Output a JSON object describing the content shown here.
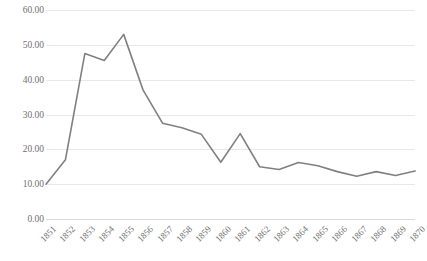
{
  "chart_data": {
    "type": "line",
    "title": "",
    "subtitle": "",
    "xlabel": "",
    "ylabel": "",
    "grid": true,
    "legend": false,
    "legend_position": "none",
    "line_color": "#808080",
    "gridline_color": "#e8e8e8",
    "tick_label_color": "#6f6f6f",
    "x_tick_rotation": -45,
    "xlim": [
      1851,
      1870
    ],
    "ylim": [
      0,
      60
    ],
    "y_tick_step": 10,
    "y_tick_labels": [
      "0.00",
      "10.00",
      "20.00",
      "30.00",
      "40.00",
      "50.00",
      "60.00"
    ],
    "y_tick_values": [
      0,
      10,
      20,
      30,
      40,
      50,
      60
    ],
    "categories": [
      "1851",
      "1852",
      "1853",
      "1854",
      "1855",
      "1856",
      "1857",
      "1858",
      "1859",
      "1860",
      "1861",
      "1862",
      "1863",
      "1864",
      "1865",
      "1866",
      "1867",
      "1868",
      "1869",
      "1870"
    ],
    "x": [
      1851,
      1852,
      1853,
      1854,
      1855,
      1856,
      1857,
      1858,
      1859,
      1860,
      1861,
      1862,
      1863,
      1864,
      1865,
      1866,
      1867,
      1868,
      1869,
      1870
    ],
    "values": [
      10.0,
      17.0,
      47.5,
      45.5,
      53.0,
      37.0,
      27.5,
      26.2,
      24.3,
      16.3,
      24.5,
      15.0,
      14.2,
      16.2,
      15.3,
      13.6,
      12.3,
      13.6,
      12.5,
      13.8
    ],
    "series": [
      {
        "name": "series-1",
        "color": "#808080",
        "values": [
          10.0,
          17.0,
          47.5,
          45.5,
          53.0,
          37.0,
          27.5,
          26.2,
          24.3,
          16.3,
          24.5,
          15.0,
          14.2,
          16.2,
          15.3,
          13.6,
          12.3,
          13.6,
          12.5,
          13.8
        ]
      }
    ],
    "annotations": []
  }
}
